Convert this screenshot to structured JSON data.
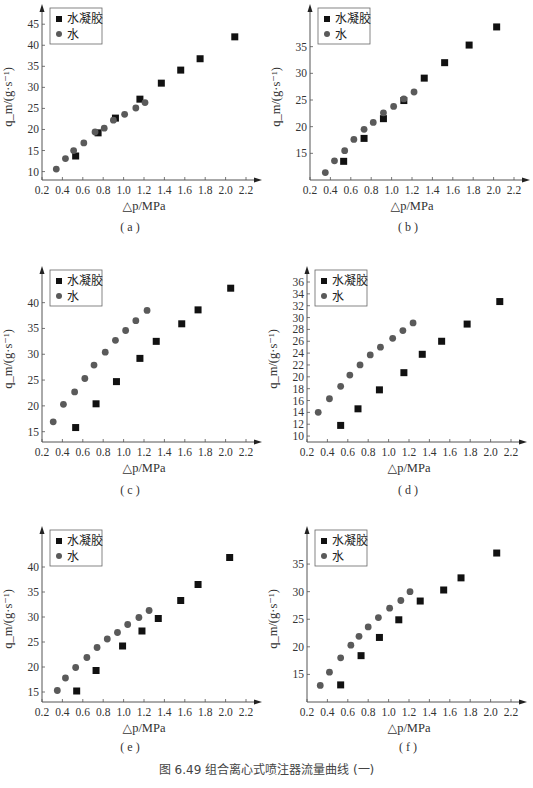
{
  "figure": {
    "caption": "图 6.49   组合离心式喷注器流量曲线 (一)"
  },
  "legend": {
    "series_gel": "水凝胶",
    "series_water": "水"
  },
  "axes": {
    "xlabel": "△p/MPa",
    "ylabel": "q_m/(g·s⁻¹)"
  },
  "colors": {
    "gel": "#111111",
    "water": "#5a5a5a",
    "axis": "#555555"
  },
  "chart_data": [
    {
      "id": "a",
      "type": "scatter",
      "panel_label": "( a )",
      "title": "",
      "xlabel": "△p/MPa",
      "ylabel": "q_m/(g·s⁻¹)",
      "xlim": [
        0.2,
        2.2
      ],
      "ylim": [
        8,
        46
      ],
      "xticks": [
        0.2,
        0.4,
        0.6,
        0.8,
        1.0,
        1.2,
        1.4,
        1.6,
        1.8,
        2.0,
        2.2
      ],
      "yticks": [
        10,
        15,
        20,
        25,
        30,
        35,
        40,
        45
      ],
      "grid": false,
      "legend_position": "upper left",
      "series": [
        {
          "name": "水凝胶",
          "marker": "square",
          "x": [
            0.53,
            0.75,
            0.92,
            1.16,
            1.37,
            1.56,
            1.75,
            2.09
          ],
          "y": [
            13.7,
            19.2,
            22.7,
            27.2,
            31.0,
            34.1,
            36.8,
            42.0
          ]
        },
        {
          "name": "水",
          "marker": "circle",
          "x": [
            0.34,
            0.43,
            0.51,
            0.61,
            0.72,
            0.81,
            0.9,
            1.01,
            1.12,
            1.21
          ],
          "y": [
            10.6,
            13.1,
            15.0,
            16.8,
            19.4,
            20.3,
            22.2,
            23.6,
            25.1,
            26.4
          ]
        }
      ]
    },
    {
      "id": "b",
      "type": "scatter",
      "panel_label": "( b )",
      "title": "",
      "xlabel": "△p/MPa",
      "ylabel": "q_m/(g·s⁻¹)",
      "xlim": [
        0.2,
        2.2
      ],
      "ylim": [
        10,
        40
      ],
      "xticks": [
        0.2,
        0.4,
        0.6,
        0.8,
        1.0,
        1.2,
        1.4,
        1.6,
        1.8,
        2.0,
        2.2
      ],
      "yticks": [
        15,
        20,
        25,
        30,
        35
      ],
      "grid": false,
      "legend_position": "upper left",
      "series": [
        {
          "name": "水凝胶",
          "marker": "square",
          "x": [
            0.53,
            0.73,
            0.92,
            1.12,
            1.32,
            1.52,
            1.76,
            2.03
          ],
          "y": [
            13.5,
            17.8,
            21.5,
            24.9,
            29.1,
            32.0,
            35.3,
            38.7
          ]
        },
        {
          "name": "水",
          "marker": "circle",
          "x": [
            0.35,
            0.44,
            0.54,
            0.63,
            0.73,
            0.82,
            0.92,
            1.02,
            1.12,
            1.22
          ],
          "y": [
            11.4,
            13.6,
            15.5,
            17.6,
            19.5,
            20.8,
            22.6,
            23.8,
            25.2,
            26.5
          ]
        }
      ]
    },
    {
      "id": "c",
      "type": "scatter",
      "panel_label": "( c )",
      "title": "",
      "xlabel": "△p/MPa",
      "ylabel": "q_m/(g·s⁻¹)",
      "xlim": [
        0.2,
        2.2
      ],
      "ylim": [
        13,
        44
      ],
      "xticks": [
        0.2,
        0.4,
        0.6,
        0.8,
        1.0,
        1.2,
        1.4,
        1.6,
        1.8,
        2.0,
        2.2
      ],
      "yticks": [
        15,
        20,
        25,
        30,
        35,
        40
      ],
      "grid": false,
      "legend_position": "upper left",
      "series": [
        {
          "name": "水凝胶",
          "marker": "square",
          "x": [
            0.53,
            0.73,
            0.93,
            1.16,
            1.32,
            1.57,
            1.73,
            2.05
          ],
          "y": [
            15.8,
            20.4,
            24.7,
            29.2,
            32.5,
            35.9,
            38.6,
            42.8
          ]
        },
        {
          "name": "水",
          "marker": "circle",
          "x": [
            0.31,
            0.41,
            0.52,
            0.62,
            0.71,
            0.82,
            0.92,
            1.02,
            1.12,
            1.23
          ],
          "y": [
            16.9,
            20.3,
            22.7,
            25.3,
            27.9,
            30.4,
            32.7,
            34.6,
            36.5,
            38.5
          ]
        }
      ]
    },
    {
      "id": "d",
      "type": "scatter",
      "panel_label": "( d )",
      "title": "",
      "xlabel": "△p/MPa",
      "ylabel": "q_m/(g·s⁻¹)",
      "xlim": [
        0.2,
        2.2
      ],
      "ylim": [
        9,
        36
      ],
      "xticks": [
        0.2,
        0.4,
        0.6,
        0.8,
        1.0,
        1.2,
        1.4,
        1.6,
        1.8,
        2.0,
        2.2
      ],
      "yticks": [
        10,
        12,
        14,
        16,
        18,
        20,
        22,
        24,
        26,
        28,
        30,
        32,
        34,
        36
      ],
      "grid": false,
      "legend_position": "upper left",
      "series": [
        {
          "name": "水凝胶",
          "marker": "square",
          "x": [
            0.53,
            0.7,
            0.91,
            1.15,
            1.33,
            1.52,
            1.77,
            2.09
          ],
          "y": [
            11.8,
            14.6,
            17.8,
            20.7,
            23.8,
            26.0,
            28.9,
            32.7
          ]
        },
        {
          "name": "水",
          "marker": "circle",
          "x": [
            0.31,
            0.42,
            0.53,
            0.62,
            0.72,
            0.82,
            0.92,
            1.04,
            1.14,
            1.24
          ],
          "y": [
            14.0,
            16.3,
            18.4,
            20.3,
            22.0,
            23.7,
            25.0,
            26.5,
            27.8,
            29.1
          ]
        }
      ]
    },
    {
      "id": "e",
      "type": "scatter",
      "panel_label": "( e )",
      "title": "",
      "xlabel": "△p/MPa",
      "ylabel": "q_m/(g·s⁻¹)",
      "xlim": [
        0.2,
        2.2
      ],
      "ylim": [
        13,
        45
      ],
      "xticks": [
        0.2,
        0.4,
        0.6,
        0.8,
        1.0,
        1.2,
        1.4,
        1.6,
        1.8,
        2.0,
        2.2
      ],
      "yticks": [
        15,
        20,
        25,
        30,
        35,
        40
      ],
      "grid": false,
      "legend_position": "upper left",
      "series": [
        {
          "name": "水凝胶",
          "marker": "square",
          "x": [
            0.54,
            0.73,
            0.99,
            1.18,
            1.34,
            1.56,
            1.73,
            2.04
          ],
          "y": [
            15.2,
            19.3,
            24.2,
            27.2,
            29.7,
            33.3,
            36.5,
            41.9
          ]
        },
        {
          "name": "水",
          "marker": "circle",
          "x": [
            0.35,
            0.43,
            0.53,
            0.64,
            0.74,
            0.84,
            0.94,
            1.04,
            1.15,
            1.25
          ],
          "y": [
            15.3,
            17.8,
            19.9,
            21.9,
            23.9,
            25.6,
            26.9,
            28.5,
            29.9,
            31.3
          ]
        }
      ]
    },
    {
      "id": "f",
      "type": "scatter",
      "panel_label": "( f )",
      "title": "",
      "xlabel": "△p/MPa",
      "ylabel": "q_m/(g·s⁻¹)",
      "xlim": [
        0.2,
        2.2
      ],
      "ylim": [
        10,
        39
      ],
      "xticks": [
        0.2,
        0.4,
        0.6,
        0.8,
        1.0,
        1.2,
        1.4,
        1.6,
        1.8,
        2.0,
        2.2
      ],
      "yticks": [
        15,
        20,
        25,
        30,
        35
      ],
      "grid": false,
      "legend_position": "upper left",
      "series": [
        {
          "name": "水凝胶",
          "marker": "square",
          "x": [
            0.53,
            0.73,
            0.91,
            1.1,
            1.31,
            1.54,
            1.71,
            2.06
          ],
          "y": [
            13.1,
            18.4,
            21.7,
            24.9,
            28.3,
            30.3,
            32.5,
            37.0
          ]
        },
        {
          "name": "水",
          "marker": "circle",
          "x": [
            0.33,
            0.42,
            0.53,
            0.63,
            0.71,
            0.8,
            0.9,
            1.01,
            1.12,
            1.21
          ],
          "y": [
            13.0,
            15.4,
            18.0,
            20.3,
            21.9,
            23.6,
            25.3,
            27.0,
            28.4,
            30.0
          ]
        }
      ]
    }
  ]
}
